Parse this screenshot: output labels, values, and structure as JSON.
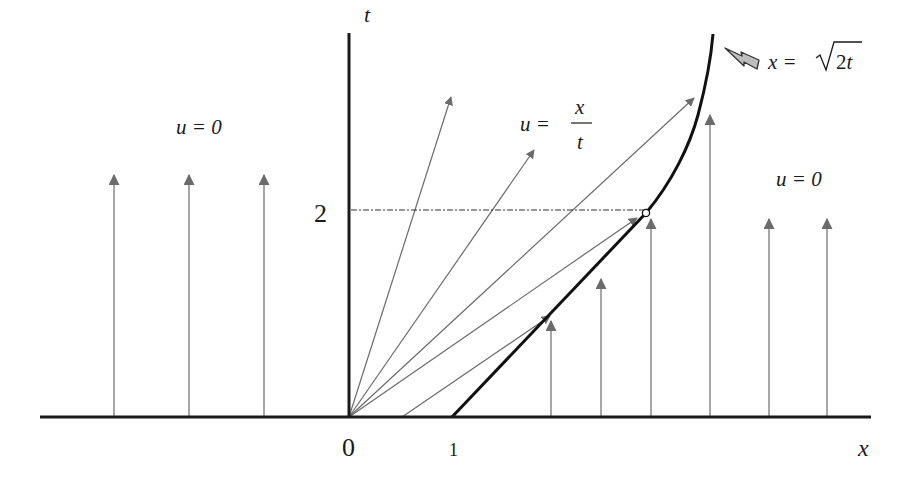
{
  "diagram": {
    "type": "characteristics-diagram",
    "axes": {
      "x_label": "x",
      "t_label": "t",
      "origin_label": "0",
      "x_tick_label": "1",
      "t_tick_label": "2"
    },
    "regions": {
      "left_label": "u = 0",
      "fan_label_lhs": "u =",
      "fan_label_num": "x",
      "fan_label_den": "t",
      "right_label": "u = 0"
    },
    "shock": {
      "label_lhs": "x =",
      "label_sqrt": "2t",
      "marker_icon": "lightning-icon"
    },
    "colors": {
      "axis": "#1a1a1a",
      "shock": "#111111",
      "characteristics": "#6b6b6b",
      "arrowhead": "#6b6b6b",
      "dashed_guide": "#333333"
    }
  }
}
